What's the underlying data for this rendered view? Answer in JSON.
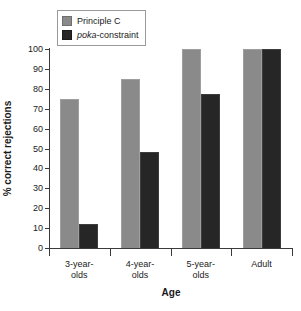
{
  "chart_data": {
    "type": "bar",
    "title": "",
    "xlabel": "Age",
    "ylabel": "% correct rejections",
    "categories": [
      "3-year-olds",
      "4-year-olds",
      "5-year-olds",
      "Adult"
    ],
    "category_lines": [
      [
        "3-year-",
        "olds"
      ],
      [
        "4-year-",
        "olds"
      ],
      [
        "5-year-",
        "olds"
      ],
      [
        "Adult",
        ""
      ]
    ],
    "series": [
      {
        "name": "Principle C",
        "color": "#8a8a8a",
        "values": [
          75,
          85,
          100,
          100
        ]
      },
      {
        "name": "poka-constraint",
        "color": "#262626",
        "values": [
          12,
          48,
          77.5,
          100
        ]
      }
    ],
    "ylim": [
      0,
      100
    ],
    "yticks": [
      0,
      10,
      20,
      30,
      40,
      50,
      60,
      70,
      80,
      90,
      100
    ],
    "ytick_labels": [
      "0",
      "10",
      "20",
      "30",
      "40",
      "50",
      "60",
      "70",
      "80",
      "90",
      "100"
    ],
    "grid": false,
    "legend_position": "top-left"
  },
  "legend": {
    "items": [
      {
        "label": "Principle C",
        "italic_prefix": "",
        "rest": "Principle C",
        "color": "#8a8a8a"
      },
      {
        "label": "poka-constraint",
        "italic_prefix": "poka",
        "rest": "-constraint",
        "color": "#262626"
      }
    ]
  },
  "colors": {
    "series_a": "#8a8a8a",
    "series_b": "#262626",
    "axis": "#3a3a3a",
    "text": "#1a1a1a",
    "background": "#ffffff"
  }
}
